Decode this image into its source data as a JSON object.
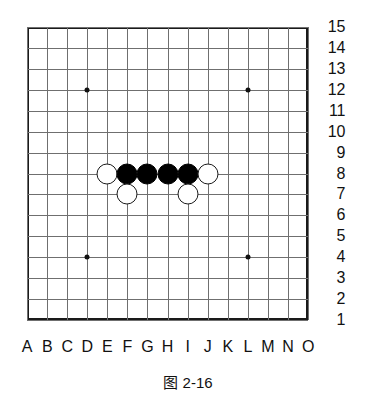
{
  "figure": {
    "caption": "图 2-16",
    "board_type": "gomoku-15x15",
    "colors": {
      "border": "#1a1a1a",
      "gridline": "#6f6f6f",
      "black_stone": "#000000",
      "white_stone": "#ffffff",
      "star_point": "#111111",
      "background": "#ffffff",
      "text": "#111111"
    }
  },
  "board": {
    "size": 15,
    "geometry": {
      "left": 27,
      "top": 27,
      "right": 308,
      "bottom": 320,
      "col_step": 20.07,
      "row_step": 20.93,
      "stone_diameter": 21
    },
    "column_labels": [
      "A",
      "B",
      "C",
      "D",
      "E",
      "F",
      "G",
      "H",
      "I",
      "J",
      "K",
      "L",
      "M",
      "N",
      "O"
    ],
    "row_labels": [
      "15",
      "14",
      "13",
      "12",
      "11",
      "10",
      "9",
      "8",
      "7",
      "6",
      "5",
      "4",
      "3",
      "2",
      "1"
    ],
    "star_points": [
      {
        "col": "D",
        "row": "12"
      },
      {
        "col": "L",
        "row": "12"
      },
      {
        "col": "D",
        "row": "4"
      },
      {
        "col": "L",
        "row": "4"
      }
    ],
    "stones": [
      {
        "color": "white",
        "col": "E",
        "row": "8"
      },
      {
        "color": "black",
        "col": "F",
        "row": "8"
      },
      {
        "color": "black",
        "col": "G",
        "row": "8"
      },
      {
        "color": "black",
        "col": "H",
        "row": "8"
      },
      {
        "color": "black",
        "col": "I",
        "row": "8"
      },
      {
        "color": "white",
        "col": "J",
        "row": "8"
      },
      {
        "color": "white",
        "col": "F",
        "row": "7"
      },
      {
        "color": "white",
        "col": "I",
        "row": "7"
      }
    ]
  }
}
